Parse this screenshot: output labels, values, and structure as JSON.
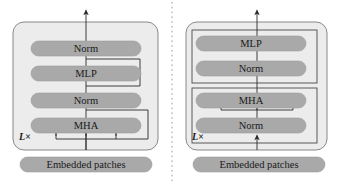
{
  "figure": {
    "type": "diagram",
    "width": 344,
    "height": 186,
    "background": "#ffffff",
    "divider": {
      "name": "panel-divider",
      "style": "dotted",
      "x": 172,
      "color": "#9a9a9a"
    }
  },
  "colors": {
    "pill_fill": "#a9a9a9",
    "pill_stroke": "#9e9e9e",
    "block_fill": "#ececec",
    "block_stroke": "#7d7d7d",
    "subblock_fill": "#ececec",
    "subblock_stroke": "#4a4a4a",
    "line": "#2b2b2b",
    "text": "#1a1a1a"
  },
  "panels": [
    {
      "id": "left",
      "name": "pre-ln-encoder-panel",
      "repeat_label": "L×",
      "input_label": "Embedded patches",
      "layers": [
        {
          "label": "Norm",
          "name": "norm-top"
        },
        {
          "label": "MLP",
          "name": "mlp"
        },
        {
          "label": "Norm",
          "name": "norm-bottom"
        },
        {
          "label": "MHA",
          "name": "mha"
        }
      ],
      "attention_inputs": 3,
      "attention_input_position": "below-mha",
      "residuals": [
        {
          "name": "mlp-residual",
          "from": "below-mlp",
          "to": "above-mlp",
          "side": "right"
        },
        {
          "name": "mha-residual",
          "from": "below-mha-bus",
          "to": "above-mha",
          "side": "right"
        }
      ],
      "output_arrow": {
        "name": "output-arrow",
        "direction": "up"
      }
    },
    {
      "id": "right",
      "name": "post-ln-encoder-panel",
      "repeat_label": "L×",
      "input_label": "Embedded patches",
      "layers": [
        {
          "label": "MLP",
          "name": "mlp"
        },
        {
          "label": "Norm",
          "name": "norm-upper"
        },
        {
          "label": "MHA",
          "name": "mha"
        },
        {
          "label": "Norm",
          "name": "norm-lower"
        }
      ],
      "attention_inputs": 3,
      "attention_input_position": "between-norm-and-mha",
      "residuals": [
        {
          "name": "upper-subblock",
          "shape": "rectangle",
          "wraps": [
            "MLP",
            "Norm"
          ]
        },
        {
          "name": "lower-subblock",
          "shape": "rectangle",
          "wraps": [
            "MHA",
            "Norm"
          ]
        }
      ],
      "output_arrow": {
        "name": "output-arrow",
        "direction": "up"
      }
    }
  ]
}
